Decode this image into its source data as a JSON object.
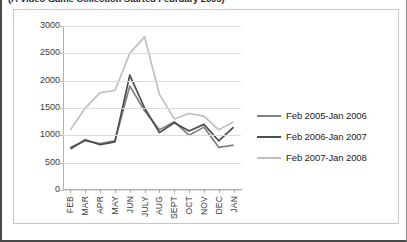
{
  "caption": "(A Video Game Collection Started February 2005)",
  "chart_data": {
    "type": "line",
    "title": "",
    "xlabel": "",
    "ylabel": "",
    "ylim": [
      0,
      3000
    ],
    "yticks": [
      0,
      500,
      1000,
      1500,
      2000,
      2500,
      3000
    ],
    "grid": true,
    "legend_position": "right",
    "categories": [
      "FEB",
      "MAR",
      "APR",
      "MAY",
      "JUN",
      "JULY",
      "AUG",
      "SEPT",
      "OCT",
      "NOV",
      "DEC",
      "JAN"
    ],
    "series": [
      {
        "name": "Feb 2005-Jan 2006",
        "color": "#808080",
        "values": [
          780,
          900,
          850,
          900,
          1900,
          1450,
          1100,
          1250,
          1000,
          1150,
          780,
          820
        ]
      },
      {
        "name": "Feb 2006-Jan 2007",
        "color": "#4d4d4d",
        "values": [
          750,
          920,
          830,
          880,
          2100,
          1500,
          1050,
          1230,
          1080,
          1200,
          900,
          1150
        ]
      },
      {
        "name": "Feb 2007-Jan 2008",
        "color": "#bfbfbf",
        "values": [
          1100,
          1500,
          1780,
          1820,
          2500,
          2800,
          1750,
          1300,
          1400,
          1350,
          1100,
          1250
        ]
      }
    ]
  }
}
